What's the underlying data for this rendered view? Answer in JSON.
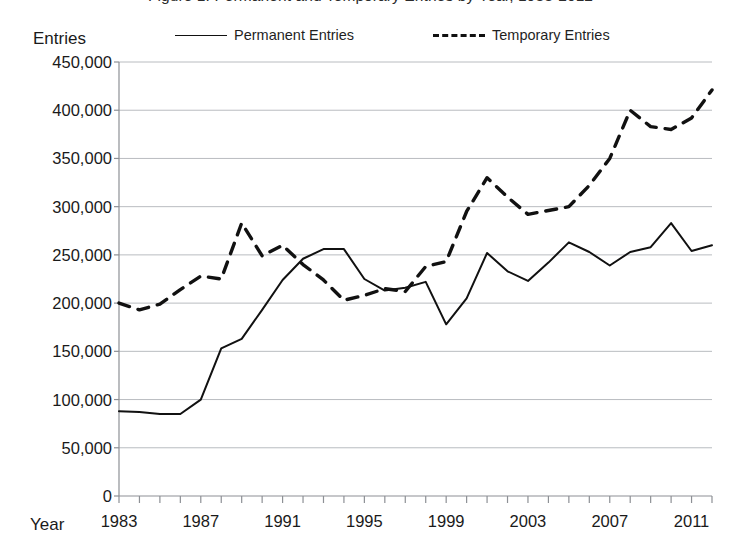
{
  "figure": {
    "title_fragment": "Figure 1. Permanent and Temporary Entries by Year, 1983-2012",
    "y_axis_title": "Entries",
    "x_axis_title": "Year"
  },
  "legend": {
    "position": "top",
    "entries": [
      {
        "label": "Permanent Entries",
        "style": "solid",
        "color": "#111111"
      },
      {
        "label": "Temporary Entries",
        "style": "dashed",
        "color": "#111111"
      }
    ]
  },
  "chart_data": {
    "type": "line",
    "title": "Figure 1. Permanent and Temporary Entries by Year, 1983-2012",
    "xlabel": "Year",
    "ylabel": "Entries",
    "xlim": [
      1983,
      2012
    ],
    "ylim": [
      0,
      450000
    ],
    "grid": true,
    "legend_position": "top",
    "y_ticks": [
      0,
      50000,
      100000,
      150000,
      200000,
      250000,
      300000,
      350000,
      400000,
      450000
    ],
    "y_tick_labels": [
      "0",
      "50,000",
      "100,000",
      "150,000",
      "200,000",
      "250,000",
      "300,000",
      "350,000",
      "400,000",
      "450,000"
    ],
    "x_ticks": [
      1983,
      1987,
      1991,
      1995,
      1999,
      2003,
      2007,
      2011
    ],
    "x_tick_labels": [
      "1983",
      "1987",
      "1991",
      "1995",
      "1999",
      "2003",
      "2007",
      "2011"
    ],
    "x_minor_tick_interval": 1,
    "x": [
      1983,
      1984,
      1985,
      1986,
      1987,
      1988,
      1989,
      1990,
      1991,
      1992,
      1993,
      1994,
      1995,
      1996,
      1997,
      1998,
      1999,
      2000,
      2001,
      2002,
      2003,
      2004,
      2005,
      2006,
      2007,
      2008,
      2009,
      2010,
      2011,
      2012
    ],
    "series": [
      {
        "name": "Permanent Entries",
        "style": "solid",
        "color": "#111111",
        "values": [
          88000,
          87000,
          85000,
          85000,
          100000,
          153000,
          163000,
          193000,
          224000,
          246000,
          256000,
          256000,
          225000,
          213000,
          216000,
          222000,
          178000,
          205000,
          252000,
          233000,
          223000,
          242000,
          263000,
          253000,
          239000,
          253000,
          258000,
          283000,
          254000,
          260000
        ]
      },
      {
        "name": "Temporary Entries",
        "style": "dashed",
        "color": "#111111",
        "values": [
          200000,
          193000,
          199000,
          214000,
          228000,
          225000,
          283000,
          249000,
          260000,
          240000,
          224000,
          203000,
          208000,
          215000,
          212000,
          238000,
          243000,
          295000,
          330000,
          310000,
          292000,
          296000,
          300000,
          322000,
          350000,
          400000,
          383000,
          380000,
          392000,
          421000
        ]
      }
    ]
  }
}
